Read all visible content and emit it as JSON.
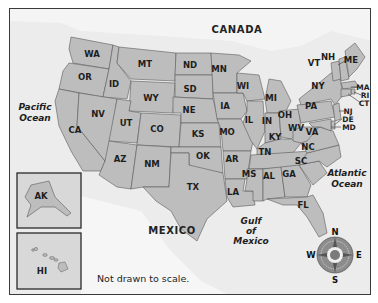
{
  "map": {
    "title": "United States",
    "countries": {
      "north": "CANADA",
      "south": "MEXICO"
    },
    "water_bodies": {
      "pacific": [
        "Pacific",
        "Ocean"
      ],
      "atlantic": [
        "Atlantic",
        "Ocean"
      ],
      "gulf": [
        "Gulf",
        "of",
        "Mexico"
      ]
    },
    "note": "Not drawn to scale.",
    "insets": {
      "alaska": "AK",
      "hawaii": "HI"
    },
    "compass": {
      "n": "N",
      "s": "S",
      "e": "E",
      "w": "W"
    },
    "states": {
      "WA": "WA",
      "OR": "OR",
      "CA": "CA",
      "ID": "ID",
      "NV": "NV",
      "MT": "MT",
      "WY": "WY",
      "UT": "UT",
      "CO": "CO",
      "AZ": "AZ",
      "NM": "NM",
      "ND": "ND",
      "SD": "SD",
      "NE": "NE",
      "KS": "KS",
      "OK": "OK",
      "TX": "TX",
      "MN": "MN",
      "IA": "IA",
      "MO": "MO",
      "AR": "AR",
      "LA": "LA",
      "WI": "WI",
      "IL": "IL",
      "MI": "MI",
      "IN": "IN",
      "OH": "OH",
      "KY": "KY",
      "TN": "TN",
      "MS": "MS",
      "AL": "AL",
      "GA": "GA",
      "FL": "FL",
      "SC": "SC",
      "NC": "NC",
      "VA": "VA",
      "WV": "WV",
      "PA": "PA",
      "NY": "NY",
      "VT": "VT",
      "NH": "NH",
      "ME": "ME",
      "MA": "MA",
      "RI": "RI",
      "CT": "CT",
      "NJ": "NJ",
      "DE": "DE",
      "MD": "MD"
    },
    "colors": {
      "land": "#bdbdbd",
      "water": "#ececec",
      "border": "#5a5a5a",
      "frame": "#3a3a3a"
    }
  }
}
